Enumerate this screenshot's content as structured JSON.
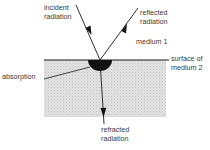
{
  "diagram": {
    "labels": {
      "incident_1": "incident",
      "incident_2": "radiation",
      "reflected_1": "reflected",
      "reflected_2": "radiation",
      "medium1": "medium 1",
      "surface_1": "surface of",
      "surface_2": "medium 2",
      "absorption": "absorption",
      "refracted_1": "refracted",
      "refracted_2": "radiation"
    },
    "colors": {
      "line": "#1a1a1a",
      "medium2_fill": "#dcdcdc",
      "absorption_blob": "#111111"
    }
  }
}
